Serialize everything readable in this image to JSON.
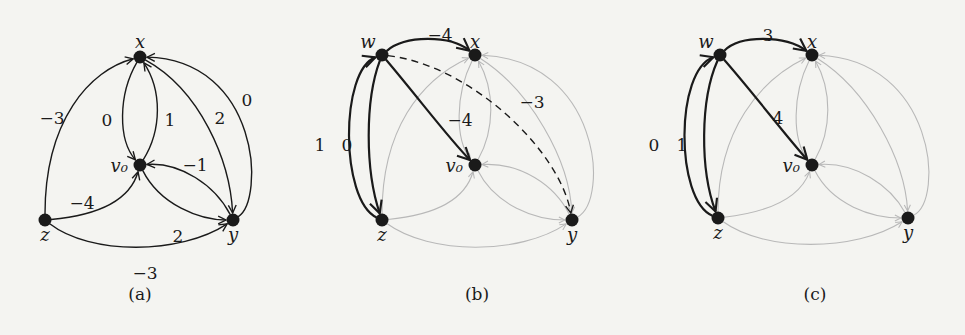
{
  "panels": [
    {
      "caption": "(a)",
      "nodes": [
        {
          "id": "x",
          "label": "x"
        },
        {
          "id": "v0",
          "label": "v₀"
        },
        {
          "id": "z",
          "label": "z"
        },
        {
          "id": "y",
          "label": "y"
        }
      ],
      "edges": [
        {
          "from": "z",
          "to": "x",
          "label": "−3",
          "style": "normal"
        },
        {
          "from": "x",
          "to": "v0",
          "label": "0",
          "style": "normal"
        },
        {
          "from": "v0",
          "to": "x",
          "label": "1",
          "style": "normal"
        },
        {
          "from": "x",
          "to": "y",
          "label": "2",
          "style": "normal"
        },
        {
          "from": "y",
          "to": "x",
          "label": "0",
          "style": "normal"
        },
        {
          "from": "y",
          "to": "v0",
          "label": "−1",
          "style": "normal"
        },
        {
          "from": "z",
          "to": "v0",
          "label": "−4",
          "style": "normal"
        },
        {
          "from": "v0",
          "to": "y",
          "label": "2",
          "style": "normal"
        },
        {
          "from": "z",
          "to": "y",
          "label": "−3",
          "style": "normal"
        }
      ]
    },
    {
      "caption": "(b)",
      "nodes": [
        {
          "id": "w",
          "label": "w"
        },
        {
          "id": "x",
          "label": "x"
        },
        {
          "id": "v0",
          "label": "v₀"
        },
        {
          "id": "z",
          "label": "z"
        },
        {
          "id": "y",
          "label": "y"
        }
      ],
      "edges": [
        {
          "from": "w",
          "to": "x",
          "label": "−4",
          "style": "bold"
        },
        {
          "from": "w",
          "to": "v0",
          "label": "−4",
          "style": "bold"
        },
        {
          "from": "w",
          "to": "y",
          "label": "−3",
          "style": "dashed"
        },
        {
          "from": "z",
          "to": "w",
          "label": "1",
          "style": "bold"
        },
        {
          "from": "w",
          "to": "z",
          "label": "0",
          "style": "bold"
        },
        {
          "from": "z",
          "to": "x",
          "label": "",
          "style": "faded"
        },
        {
          "from": "x",
          "to": "v0",
          "label": "",
          "style": "faded"
        },
        {
          "from": "v0",
          "to": "x",
          "label": "",
          "style": "faded"
        },
        {
          "from": "x",
          "to": "y",
          "label": "",
          "style": "faded"
        },
        {
          "from": "y",
          "to": "x",
          "label": "",
          "style": "faded"
        },
        {
          "from": "y",
          "to": "v0",
          "label": "",
          "style": "faded"
        },
        {
          "from": "z",
          "to": "v0",
          "label": "",
          "style": "faded"
        },
        {
          "from": "v0",
          "to": "y",
          "label": "",
          "style": "faded"
        },
        {
          "from": "z",
          "to": "y",
          "label": "",
          "style": "faded"
        }
      ]
    },
    {
      "caption": "(c)",
      "nodes": [
        {
          "id": "w",
          "label": "w"
        },
        {
          "id": "x",
          "label": "x"
        },
        {
          "id": "v0",
          "label": "v₀"
        },
        {
          "id": "z",
          "label": "z"
        },
        {
          "id": "y",
          "label": "y"
        }
      ],
      "edges": [
        {
          "from": "w",
          "to": "x",
          "label": "3",
          "style": "bold"
        },
        {
          "from": "w",
          "to": "v0",
          "label": "4",
          "style": "bold"
        },
        {
          "from": "z",
          "to": "w",
          "label": "0",
          "style": "bold"
        },
        {
          "from": "w",
          "to": "z",
          "label": "1",
          "style": "bold"
        },
        {
          "from": "z",
          "to": "x",
          "label": "",
          "style": "faded"
        },
        {
          "from": "x",
          "to": "v0",
          "label": "",
          "style": "faded"
        },
        {
          "from": "v0",
          "to": "x",
          "label": "",
          "style": "faded"
        },
        {
          "from": "x",
          "to": "y",
          "label": "",
          "style": "faded"
        },
        {
          "from": "y",
          "to": "x",
          "label": "",
          "style": "faded"
        },
        {
          "from": "y",
          "to": "v0",
          "label": "",
          "style": "faded"
        },
        {
          "from": "z",
          "to": "v0",
          "label": "",
          "style": "faded"
        },
        {
          "from": "v0",
          "to": "y",
          "label": "",
          "style": "faded"
        },
        {
          "from": "z",
          "to": "y",
          "label": "",
          "style": "faded"
        }
      ]
    }
  ],
  "colors": {
    "ink": "#1a1a1a",
    "faded": "#b8b8b8"
  }
}
